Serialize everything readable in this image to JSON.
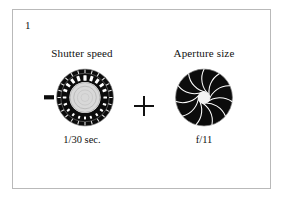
{
  "figure": {
    "number_label": "1",
    "frame_color": "#b9b9b9",
    "background_color": "#ffffff",
    "ink_color": "#111111"
  },
  "operator": {
    "symbol": "+",
    "name": "plus-sign"
  },
  "panels": [
    {
      "id": "shutter",
      "title": "Shutter speed",
      "caption": "1/30 sec.",
      "illustration": "shutter-speed-dial",
      "illustration_colors": {
        "ring": "#0c0c0c",
        "ticks": "#ffffff",
        "hub": "#d8d8d8",
        "index_mark": "#0c0c0c"
      }
    },
    {
      "id": "aperture",
      "title": "Aperture size",
      "caption": "f/11",
      "illustration": "aperture-iris-diaphragm",
      "illustration_colors": {
        "body": "#0c0c0c",
        "blade_lines": "#ffffff",
        "opening": "#f2f2f2"
      },
      "blade_count": 11
    }
  ]
}
